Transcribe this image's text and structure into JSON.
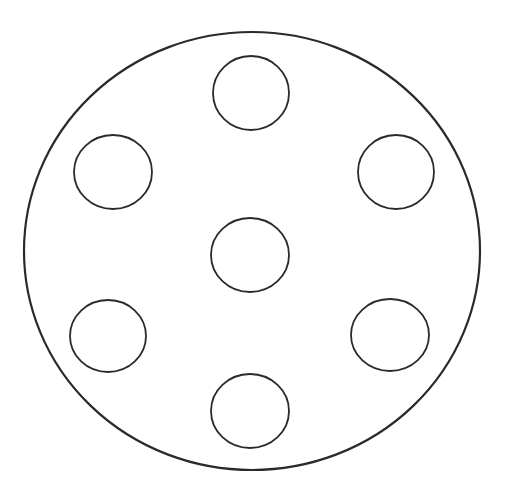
{
  "canvas": {
    "width": 508,
    "height": 487,
    "background": "#ffffff"
  },
  "stroke_color": "#2a2a2a",
  "outer_circle": {
    "cx": 252,
    "cy": 251,
    "rx": 228,
    "ry": 219,
    "stroke_width": 2.2
  },
  "inner_circles": [
    {
      "id": "top",
      "cx": 251,
      "cy": 93,
      "rx": 38,
      "ry": 37
    },
    {
      "id": "upper-left",
      "cx": 113,
      "cy": 172,
      "rx": 39,
      "ry": 37
    },
    {
      "id": "upper-right",
      "cx": 396,
      "cy": 172,
      "rx": 38,
      "ry": 37
    },
    {
      "id": "center",
      "cx": 250,
      "cy": 255,
      "rx": 39,
      "ry": 37
    },
    {
      "id": "lower-left",
      "cx": 108,
      "cy": 336,
      "rx": 38,
      "ry": 36
    },
    {
      "id": "lower-right",
      "cx": 390,
      "cy": 335,
      "rx": 39,
      "ry": 36
    },
    {
      "id": "bottom",
      "cx": 250,
      "cy": 411,
      "rx": 39,
      "ry": 37
    }
  ],
  "inner_stroke_width": 1.8
}
